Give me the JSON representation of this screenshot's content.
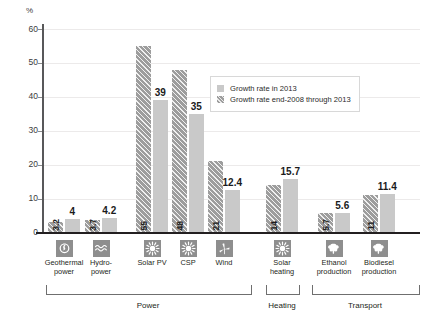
{
  "chart_data": {
    "type": "bar",
    "title": "",
    "xlabel": "",
    "ylabel": "%",
    "ylim": [
      0,
      60
    ],
    "yticks": [
      0,
      10,
      20,
      30,
      40,
      50,
      60
    ],
    "grid": true,
    "legend_position": "upper right",
    "categories": [
      "Geothermal power",
      "Hydropower",
      "Solar PV",
      "CSP",
      "Wind",
      "Solar heating",
      "Ethanol production",
      "Biodiesel production"
    ],
    "series": [
      {
        "name": "Growth rate end-2008 through 2013",
        "color": "#9d9d9d",
        "pattern": "diagonal-hatch",
        "values": [
          3.2,
          3.7,
          55,
          48,
          21,
          14,
          5.7,
          11
        ]
      },
      {
        "name": "Growth rate in 2013",
        "color": "#c9c9c9",
        "pattern": "solid",
        "values": [
          4,
          4.2,
          39,
          35,
          12.4,
          15.7,
          5.6,
          11.4
        ]
      }
    ],
    "groups": [
      {
        "label": "Power",
        "categories": [
          "Geothermal power",
          "Hydropower",
          "Solar PV",
          "CSP",
          "Wind"
        ]
      },
      {
        "label": "Heating",
        "categories": [
          "Solar heating"
        ]
      },
      {
        "label": "Transport",
        "categories": [
          "Ethanol production",
          "Biodiesel production"
        ]
      }
    ]
  },
  "axis": {
    "unit_label": "%",
    "ticks": [
      "60",
      "50",
      "40",
      "30",
      "20",
      "10",
      "0"
    ]
  },
  "legend": {
    "items": [
      {
        "label": "Growth rate in 2013",
        "style": "light"
      },
      {
        "label": "Growth rate end-2008 through 2013",
        "style": "dark"
      }
    ]
  },
  "bars": [
    {
      "key": "geothermal",
      "icon": "geothermal-icon",
      "label": "Geothermal\npower",
      "dark_value": "3.2",
      "light_value": "4"
    },
    {
      "key": "hydro",
      "icon": "wave-icon",
      "label": "Hydro-\npower",
      "dark_value": "3.7",
      "light_value": "4.2"
    },
    {
      "key": "solar-pv",
      "icon": "sun-icon",
      "label": "Solar PV",
      "dark_value": "55",
      "light_value": "39"
    },
    {
      "key": "csp",
      "icon": "sun-icon",
      "label": "CSP",
      "dark_value": "48",
      "light_value": "35"
    },
    {
      "key": "wind",
      "icon": "wind-turbine-icon",
      "label": "Wind",
      "dark_value": "21",
      "light_value": "12.4"
    },
    {
      "key": "solar-heating",
      "icon": "sun-icon",
      "label": "Solar\nheating",
      "dark_value": "14",
      "light_value": "15.7"
    },
    {
      "key": "ethanol",
      "icon": "leaf-icon",
      "label": "Ethanol\nproduction",
      "dark_value": "5.7",
      "light_value": "5.6"
    },
    {
      "key": "biodiesel",
      "icon": "leaf-icon",
      "label": "Biodiesel\nproduction",
      "dark_value": "11",
      "light_value": "11.4"
    }
  ],
  "sections": [
    {
      "label": "Power"
    },
    {
      "label": "Heating"
    },
    {
      "label": "Transport"
    }
  ]
}
